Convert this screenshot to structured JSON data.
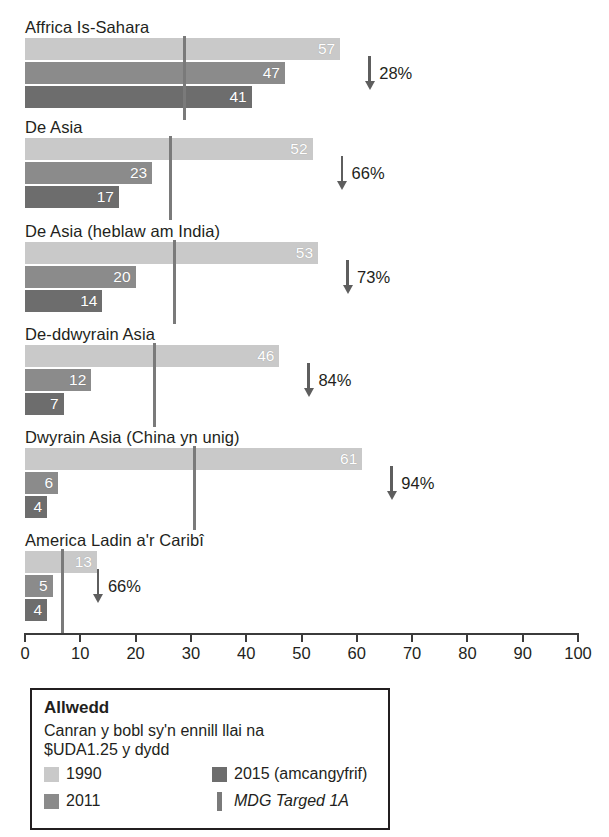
{
  "chart_data": {
    "type": "bar",
    "orientation": "horizontal",
    "title": "",
    "xlabel": "",
    "ylabel": "",
    "xlim": [
      0,
      100
    ],
    "xticks": [
      "0",
      "10",
      "20",
      "30",
      "40",
      "50",
      "60",
      "70",
      "80",
      "90",
      "100"
    ],
    "grid": false,
    "legend_position": "bottom-left",
    "categories": [
      "Affrica Is-Sahara",
      "De Asia",
      "De Asia (heblaw am India)",
      "De-ddwyrain Asia",
      "Dwyrain Asia (China yn unig)",
      "America Ladin a'r Caribî"
    ],
    "series": [
      {
        "name": "1990",
        "color": "#c9c9c9",
        "values": [
          57,
          52,
          53,
          46,
          61,
          13
        ]
      },
      {
        "name": "2011",
        "color": "#8b8b8b",
        "values": [
          47,
          23,
          20,
          12,
          6,
          5
        ]
      },
      {
        "name": "2015 (amcangyfrif)",
        "color": "#6d6d6d",
        "values": [
          41,
          17,
          14,
          7,
          4,
          4
        ]
      }
    ],
    "target_marker": {
      "name": "MDG Targed 1A",
      "color": "#7a7a7a",
      "values": [
        28.5,
        26.0,
        26.8,
        23.2,
        30.4,
        6.5
      ]
    },
    "annotations": [
      {
        "category": "Affrica Is-Sahara",
        "label": "28%",
        "direction": "down"
      },
      {
        "category": "De Asia",
        "label": "66%",
        "direction": "down"
      },
      {
        "category": "De Asia (heblaw am India)",
        "label": "73%",
        "direction": "down"
      },
      {
        "category": "De-ddwyrain Asia",
        "label": "84%",
        "direction": "down"
      },
      {
        "category": "Dwyrain Asia (China yn unig)",
        "label": "94%",
        "direction": "down"
      },
      {
        "category": "America Ladin a'r Caribî",
        "label": "66%",
        "direction": "down"
      }
    ]
  },
  "groups": [
    {
      "label": "Affrica Is-Sahara",
      "bars": [
        {
          "series": "1990",
          "value": 57,
          "value_label": "57"
        },
        {
          "series": "2011",
          "value": 47,
          "value_label": "47"
        },
        {
          "series": "2015 (amcangyfrif)",
          "value": 41,
          "value_label": "41"
        }
      ],
      "target": 28.5,
      "reduction": "28%"
    },
    {
      "label": "De Asia",
      "bars": [
        {
          "series": "1990",
          "value": 52,
          "value_label": "52"
        },
        {
          "series": "2011",
          "value": 23,
          "value_label": "23"
        },
        {
          "series": "2015 (amcangyfrif)",
          "value": 17,
          "value_label": "17"
        }
      ],
      "target": 26.0,
      "reduction": "66%"
    },
    {
      "label": "De Asia (heblaw am India)",
      "bars": [
        {
          "series": "1990",
          "value": 53,
          "value_label": "53"
        },
        {
          "series": "2011",
          "value": 20,
          "value_label": "20"
        },
        {
          "series": "2015 (amcangyfrif)",
          "value": 14,
          "value_label": "14"
        }
      ],
      "target": 26.8,
      "reduction": "73%"
    },
    {
      "label": "De-ddwyrain Asia",
      "bars": [
        {
          "series": "1990",
          "value": 46,
          "value_label": "46"
        },
        {
          "series": "2011",
          "value": 12,
          "value_label": "12"
        },
        {
          "series": "2015 (amcangyfrif)",
          "value": 7,
          "value_label": "7"
        }
      ],
      "target": 23.2,
      "reduction": "84%"
    },
    {
      "label": "Dwyrain Asia (China yn unig)",
      "bars": [
        {
          "series": "1990",
          "value": 61,
          "value_label": "61"
        },
        {
          "series": "2011",
          "value": 6,
          "value_label": "6"
        },
        {
          "series": "2015 (amcangyfrif)",
          "value": 4,
          "value_label": "4"
        }
      ],
      "target": 30.4,
      "reduction": "94%"
    },
    {
      "label": "America Ladin a'r Caribî",
      "bars": [
        {
          "series": "1990",
          "value": 13,
          "value_label": "13"
        },
        {
          "series": "2011",
          "value": 5,
          "value_label": "5"
        },
        {
          "series": "2015 (amcangyfrif)",
          "value": 4,
          "value_label": "4"
        }
      ],
      "target": 6.5,
      "reduction": "66%"
    }
  ],
  "axis": {
    "ticks": [
      "0",
      "10",
      "20",
      "30",
      "40",
      "50",
      "60",
      "70",
      "80",
      "90",
      "100"
    ]
  },
  "legend": {
    "title": "Allwedd",
    "description_line1": "Canran y bobl sy'n ennill llai na",
    "description_line2": "$UDA1.25 y dydd",
    "entries": [
      {
        "label": "1990",
        "color": "#c9c9c9",
        "kind": "swatch"
      },
      {
        "label": "2015 (amcangyfrif)",
        "color": "#6d6d6d",
        "kind": "swatch"
      },
      {
        "label": "2011",
        "color": "#8b8b8b",
        "kind": "swatch"
      },
      {
        "label": "MDG Targed 1A",
        "color": "#7a7a7a",
        "kind": "line"
      }
    ]
  },
  "colors": {
    "series_1990": "#c9c9c9",
    "series_2011": "#8b8b8b",
    "series_2015": "#6d6d6d",
    "target_line": "#7a7a7a",
    "axis": "#3b3b3b",
    "text": "#231f20"
  }
}
